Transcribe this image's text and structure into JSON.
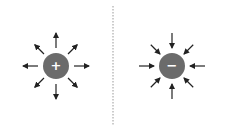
{
  "diagram": {
    "title": "",
    "divider": {
      "style": "dotted",
      "x": 113,
      "color": "#999999"
    },
    "charges": [
      {
        "id": "positive",
        "sign": "+",
        "cx": 56,
        "cy": 66,
        "r": 13,
        "fill": "#6b6b6b",
        "field_direction": "outward"
      },
      {
        "id": "negative",
        "sign": "−",
        "cx": 172,
        "cy": 66,
        "r": 13,
        "fill": "#6b6b6b",
        "field_direction": "inward"
      }
    ],
    "arrow_color": "#222222",
    "arrow_count_per_charge": 8
  }
}
